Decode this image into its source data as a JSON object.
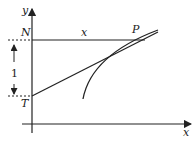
{
  "diagram": {
    "labels": {
      "y_axis": "y",
      "x_axis": "x",
      "point_n": "N",
      "point_p": "P",
      "point_t": "T",
      "segment_np": "x",
      "distance_nt": "1"
    },
    "colors": {
      "stroke": "#222222",
      "background": "#ffffff"
    }
  }
}
